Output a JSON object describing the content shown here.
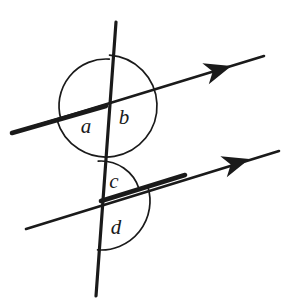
{
  "figure": {
    "background_color": "#ffffff",
    "stroke_color": "#1a1a1a",
    "width": 294,
    "height": 305
  },
  "labels": {
    "a": "a",
    "b": "b",
    "c": "c",
    "d": "d"
  },
  "label_positions": {
    "a": {
      "x": 86,
      "y": 128
    },
    "b": {
      "x": 124,
      "y": 119
    },
    "c": {
      "x": 114,
      "y": 183
    },
    "d": {
      "x": 116,
      "y": 229
    }
  },
  "geometry": {
    "transversal": {
      "name": "transversal-line",
      "x1": 116,
      "y1": 22,
      "x2": 96,
      "y2": 296,
      "stroke_width": 3.2
    },
    "upper_parallel": {
      "name": "upper-parallel-line",
      "x1": 12,
      "y1": 133,
      "x2": 264,
      "y2": 56,
      "stroke_width": 2.6,
      "thick_segment": {
        "x1": 12,
        "y1": 133,
        "x2": 106,
        "y2": 106,
        "stroke_width": 4.6
      },
      "arrow": {
        "x": 218,
        "y": 70,
        "angle": -17
      }
    },
    "lower_parallel": {
      "name": "lower-parallel-line",
      "x1": 26,
      "y1": 229,
      "x2": 279,
      "y2": 151,
      "stroke_width": 2.6,
      "thick_segment": {
        "x1": 101,
        "y1": 201,
        "x2": 185,
        "y2": 175,
        "stroke_width": 4.6
      },
      "arrow": {
        "x": 236,
        "y": 163,
        "angle": -17
      }
    },
    "upper_intersection": {
      "x": 106,
      "y": 106
    },
    "lower_intersection": {
      "x": 101,
      "y": 201
    }
  },
  "arcs": {
    "a": {
      "name": "angle-arc-a",
      "radius": 47,
      "start_deg": 164,
      "end_deg": 274,
      "stroke_width": 1.7
    },
    "b": {
      "name": "angle-arc-b",
      "radius": 51,
      "start_deg": 274,
      "end_deg": 524,
      "stroke_width": 1.7
    },
    "c": {
      "name": "angle-arc-c",
      "radius": 40,
      "start_deg": 266,
      "end_deg": 343,
      "stroke_width": 1.7
    },
    "d": {
      "name": "angle-arc-d",
      "radius": 49,
      "start_deg": 343,
      "end_deg": 454,
      "stroke_width": 1.7
    }
  },
  "chart_data": {
    "type": "diagram",
    "elements": [
      {
        "kind": "line",
        "role": "parallel",
        "label": "upper parallel line",
        "direction_deg": -17,
        "arrow": true
      },
      {
        "kind": "line",
        "role": "parallel",
        "label": "lower parallel line",
        "direction_deg": -17,
        "arrow": true
      },
      {
        "kind": "line",
        "role": "transversal",
        "label": "transversal",
        "direction_deg": 94,
        "arrow": false
      }
    ],
    "angles": [
      {
        "name": "a",
        "position": "upper intersection, lower-left",
        "type": "obtuse"
      },
      {
        "name": "b",
        "position": "upper intersection, right (reflex side)",
        "type": "reflex"
      },
      {
        "name": "c",
        "position": "lower intersection, upper-right",
        "type": "acute"
      },
      {
        "name": "d",
        "position": "lower intersection, lower-right",
        "type": "obtuse"
      }
    ],
    "annotations": [
      "a",
      "b",
      "c",
      "d"
    ]
  }
}
